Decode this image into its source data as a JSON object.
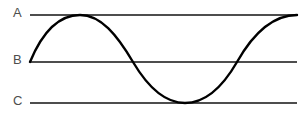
{
  "figure": {
    "width": 303,
    "height": 117,
    "background_color": "#ffffff"
  },
  "labels": {
    "top": "A",
    "middle": "B",
    "bottom": "C"
  },
  "colors": {
    "reference_line": "#4d4d4d",
    "curve": "#000000",
    "label_text": "#4d4d4d"
  },
  "chart_data": {
    "type": "line",
    "title": "",
    "xlabel": "",
    "ylabel": "",
    "grid": false,
    "legend": null,
    "xlim": [
      30,
      297
    ],
    "ylim": [
      103,
      15
    ],
    "reference_lines": [
      {
        "label": "A",
        "y": 15,
        "x_start": 30,
        "x_end": 297
      },
      {
        "label": "B",
        "y": 62,
        "x_start": 30,
        "x_end": 297
      },
      {
        "label": "C",
        "y": 103,
        "x_start": 30,
        "x_end": 297
      }
    ],
    "series": [
      {
        "name": "sine-curve",
        "description": "One full sine cycle starting at level B, peaking at level A, troughing at level C, returning to level A",
        "amplitude_levels": {
          "max": "A",
          "mid": "B",
          "min": "C"
        },
        "key_points": [
          {
            "x": 30,
            "y": 62,
            "note": "start at B"
          },
          {
            "x": 80,
            "y": 15,
            "note": "peak touches A"
          },
          {
            "x": 133,
            "y": 62,
            "note": "descending crossing of B"
          },
          {
            "x": 185,
            "y": 103,
            "note": "trough touches C"
          },
          {
            "x": 237,
            "y": 62,
            "note": "ascending crossing of B"
          },
          {
            "x": 297,
            "y": 15,
            "note": "end at A"
          }
        ],
        "path": "M30,62 C44,28 62,15 80,15 C101,15 117,35 133,62 C149,89 166,103 185,103 C205,103 222,88 237,62 C254,32 274,15 297,15"
      }
    ]
  }
}
